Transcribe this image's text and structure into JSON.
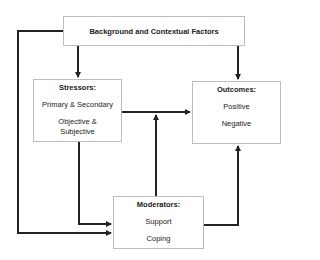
{
  "diagram": {
    "background": {
      "label": "Background and Contextual Factors"
    },
    "stressors": {
      "title": "Stressors:",
      "items": [
        "Primary & Secondary",
        "Objective &",
        "Subjective"
      ]
    },
    "outcomes": {
      "title": "Outcomes:",
      "items": [
        "Positive",
        "Negative"
      ]
    },
    "moderators": {
      "title": "Moderators:",
      "items": [
        "Support",
        "Coping"
      ]
    },
    "edges": [
      {
        "from": "Background and Contextual Factors",
        "to": "Stressors"
      },
      {
        "from": "Background and Contextual Factors",
        "to": "Outcomes"
      },
      {
        "from": "Background and Contextual Factors",
        "to": "Moderators"
      },
      {
        "from": "Stressors",
        "to": "Outcomes"
      },
      {
        "from": "Stressors",
        "to": "Moderators"
      },
      {
        "from": "Moderators",
        "to": "Stressors-Outcomes link"
      },
      {
        "from": "Moderators",
        "to": "Outcomes"
      }
    ]
  }
}
